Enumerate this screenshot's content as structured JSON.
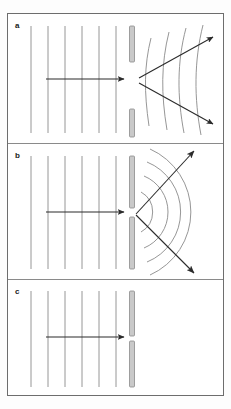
{
  "figure": {
    "width": 231,
    "height": 409,
    "background_color": "#fdfdfd",
    "frame_color": "#6d6d6d",
    "wavefront_color": "#8a8a8a",
    "arrow_color": "#2b2b2b",
    "barrier_fill": "#c9c9c9",
    "barrier_stroke": "#8a8a8a"
  },
  "panels": [
    {
      "label": "a",
      "description": "Plane waves reach a wide aperture; transmitted wavefronts bend only slightly at the edges and spread over a narrow angle.",
      "aperture": "wide",
      "incident": {
        "wavefront_count": 6,
        "wavefront_type": "plane",
        "direction_arrow": "horizontal-right"
      },
      "transmitted": {
        "wavefront_count": 4,
        "wavefront_type": "slightly-curved",
        "spread": "narrow",
        "ray_arrows": 2,
        "ray_angles_deg": [
          -22,
          22
        ]
      }
    },
    {
      "label": "b",
      "description": "Plane waves reach a narrow slit comparable to the wavelength; transmitted waves become circular and spread over a wide angle.",
      "aperture": "narrow",
      "incident": {
        "wavefront_count": 6,
        "wavefront_type": "plane",
        "direction_arrow": "horizontal-right"
      },
      "transmitted": {
        "wavefront_count": 4,
        "wavefront_type": "circular",
        "spread": "wide",
        "ray_arrows": 2,
        "ray_angles_deg": [
          -48,
          48
        ]
      }
    },
    {
      "label": "c",
      "description": "The barrier is effectively closed; plane waves arrive but nothing is transmitted beyond the barrier.",
      "aperture": "closed",
      "incident": {
        "wavefront_count": 6,
        "wavefront_type": "plane",
        "direction_arrow": "horizontal-right"
      },
      "transmitted": {
        "wavefront_count": 0,
        "wavefront_type": "none",
        "spread": "none",
        "ray_arrows": 0,
        "ray_angles_deg": []
      }
    }
  ]
}
